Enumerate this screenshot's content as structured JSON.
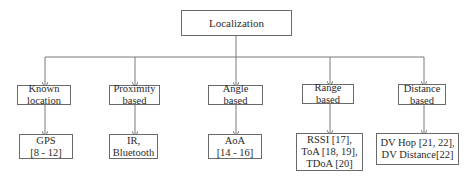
{
  "diagram": {
    "type": "tree",
    "root": {
      "label": "Localization"
    },
    "categories": [
      {
        "label": "Known\nlocation",
        "leaf": "GPS\n[8 - 12]"
      },
      {
        "label": "Proximity\nbased",
        "leaf": "IR,\nBluetooth"
      },
      {
        "label": "Angle\nbased",
        "leaf": "AoA\n[14 - 16]"
      },
      {
        "label": "Range\nbased",
        "leaf": "RSSI [17],\nToA [18, 19],\nTDoA [20]"
      },
      {
        "label": "Distance\nbased",
        "leaf": "DV Hop [21, 22],\nDV Distance[22]"
      }
    ],
    "colors": {
      "line": "#7a7a7a",
      "border": "#6a6a6a",
      "text": "#2a2a2a"
    }
  }
}
